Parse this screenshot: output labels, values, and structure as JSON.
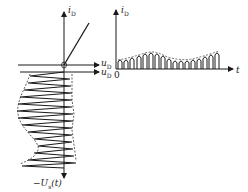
{
  "left_plot": {
    "y_axis_label": "i",
    "y_axis_sub": "D",
    "x_axis_label_top": "u",
    "x_axis_sub_top": "D",
    "x_axis_label_bottom": "u",
    "x_axis_sub_bottom": "D",
    "origin_label": "0",
    "input_signal_label": "−U",
    "input_signal_sub": "s",
    "input_signal_suffix": "(t)"
  },
  "right_plot": {
    "y_axis_label": "i",
    "y_axis_sub": "D",
    "x_axis_label": "t",
    "origin_label": "0"
  },
  "colors": {
    "line": "#1a1a1a",
    "background": "#ffffff"
  }
}
